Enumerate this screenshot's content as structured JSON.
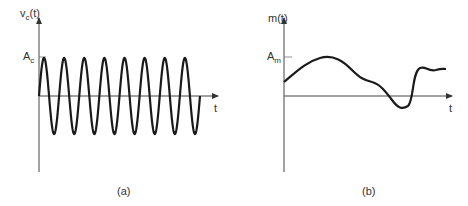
{
  "panel_a": {
    "ylabel_main": "v",
    "ylabel_sub": "c",
    "ylabel_tail": "(t)",
    "amp_main": "A",
    "amp_sub": "c",
    "xlabel": "t",
    "caption": "(a)",
    "cycles": 8
  },
  "panel_b": {
    "ylabel": "m(t)",
    "amp_main": "A",
    "amp_sub": "m",
    "xlabel": "t",
    "caption": "(b)"
  },
  "colors": {
    "stroke": "#1a1a1a",
    "axis": "#444444"
  }
}
